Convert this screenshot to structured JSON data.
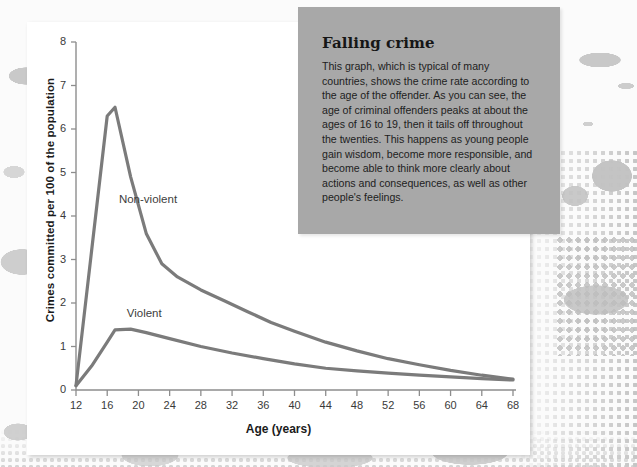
{
  "callout": {
    "title": "Falling crime",
    "body": "This graph, which is typical of many countries, shows the crime rate according to the age of the offender. As you can see, the age of criminal offenders peaks at about the ages of 16 to 19, then it tails off throughout the twenties. This happens as young people gain wisdom, become more responsible, and become able to think more clearly about actions and consequences, as well as other people's feelings.",
    "bg_color": "#a8a8a8"
  },
  "chart_data": {
    "type": "line",
    "title": "",
    "xlabel": "Age (years)",
    "ylabel": "Crimes committed per 100 of the population",
    "xlim": [
      12,
      68
    ],
    "ylim": [
      0,
      8
    ],
    "xticks": [
      12,
      16,
      20,
      24,
      28,
      32,
      36,
      40,
      44,
      48,
      52,
      56,
      60,
      64,
      68
    ],
    "yticks": [
      0,
      1,
      2,
      3,
      4,
      5,
      6,
      7,
      8
    ],
    "grid": false,
    "legend_position": "inline-labels",
    "line_color": "#7b7b7b",
    "series": [
      {
        "name": "Non-violent",
        "x": [
          12,
          14,
          16,
          17,
          19,
          21,
          23,
          25,
          28,
          31,
          34,
          37,
          40,
          44,
          48,
          52,
          56,
          60,
          64,
          68
        ],
        "values": [
          0.1,
          3.2,
          6.3,
          6.5,
          4.9,
          3.6,
          2.9,
          2.6,
          2.3,
          2.05,
          1.8,
          1.55,
          1.35,
          1.1,
          0.9,
          0.72,
          0.58,
          0.45,
          0.34,
          0.25
        ]
      },
      {
        "name": "Violent",
        "x": [
          12,
          14,
          16,
          17,
          19,
          21,
          24,
          28,
          32,
          36,
          40,
          44,
          48,
          52,
          56,
          60,
          64,
          68
        ],
        "values": [
          0.1,
          0.55,
          1.1,
          1.38,
          1.4,
          1.32,
          1.18,
          1.0,
          0.85,
          0.72,
          0.6,
          0.5,
          0.44,
          0.39,
          0.34,
          0.3,
          0.26,
          0.23
        ]
      }
    ],
    "annotations": [
      {
        "text": "Non-violent",
        "x": 17.5,
        "y": 4.35
      },
      {
        "text": "Violent",
        "x": 18.5,
        "y": 1.72
      }
    ]
  }
}
